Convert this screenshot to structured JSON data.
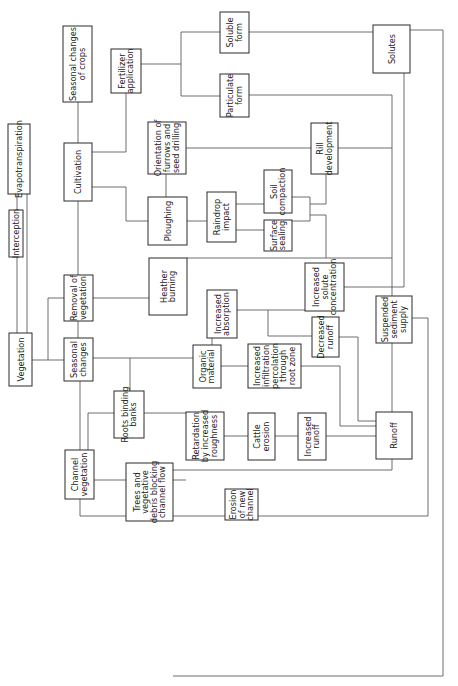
{
  "diagram": {
    "orientation": "rotated-90-ccw",
    "nodes": [
      {
        "id": "vegetation",
        "lines": [
          "Vegetation"
        ],
        "x": 9,
        "y": 333,
        "w": 23,
        "h": 53
      },
      {
        "id": "interception",
        "lines": [
          "Interception"
        ],
        "x": 9,
        "y": 210,
        "w": 14,
        "h": 47
      },
      {
        "id": "evapotranspiration",
        "lines": [
          "Evapotranspiration"
        ],
        "x": 8,
        "y": 124,
        "w": 22,
        "h": 70
      },
      {
        "id": "seasonal-changes-crops",
        "lines": [
          "Seasonal changes",
          "of crops"
        ],
        "x": 63,
        "y": 26,
        "w": 29,
        "h": 76
      },
      {
        "id": "cultivation",
        "lines": [
          "Cultivation"
        ],
        "x": 64,
        "y": 143,
        "w": 28,
        "h": 58
      },
      {
        "id": "fertilizer-application",
        "lines": [
          "Fertilizer",
          "application"
        ],
        "x": 111,
        "y": 49,
        "w": 30,
        "h": 44
      },
      {
        "id": "removal-of-vegetation",
        "lines": [
          "Removal of",
          "vegetation"
        ],
        "x": 64,
        "y": 275,
        "w": 29,
        "h": 46
      },
      {
        "id": "seasonal-changes",
        "lines": [
          "Seasonal",
          "changes"
        ],
        "x": 64,
        "y": 338,
        "w": 29,
        "h": 43
      },
      {
        "id": "channel-vegetation",
        "lines": [
          "Channel",
          "vegetation"
        ],
        "x": 65,
        "y": 450,
        "w": 29,
        "h": 49
      },
      {
        "id": "orientation-furrows",
        "lines": [
          "Orientation of",
          "furrows and",
          "seed drilling"
        ],
        "x": 148,
        "y": 122,
        "w": 38,
        "h": 52
      },
      {
        "id": "ploughing",
        "lines": [
          "Ploughing"
        ],
        "x": 148,
        "y": 197,
        "w": 39,
        "h": 48
      },
      {
        "id": "heather-burning",
        "lines": [
          "Heather",
          "burning"
        ],
        "x": 149,
        "y": 258,
        "w": 38,
        "h": 57
      },
      {
        "id": "soluble-form",
        "lines": [
          "Soluble",
          "form"
        ],
        "x": 220,
        "y": 12,
        "w": 29,
        "h": 41
      },
      {
        "id": "particulate-form",
        "lines": [
          "Particulate",
          "form"
        ],
        "x": 220,
        "y": 74,
        "w": 29,
        "h": 43
      },
      {
        "id": "raindrop-impact",
        "lines": [
          "Raindrop",
          "impact"
        ],
        "x": 207,
        "y": 192,
        "w": 29,
        "h": 50
      },
      {
        "id": "soil-compaction",
        "lines": [
          "Soil",
          "compaction"
        ],
        "x": 264,
        "y": 170,
        "w": 28,
        "h": 43
      },
      {
        "id": "surface-sealing",
        "lines": [
          "Surface",
          "sealing"
        ],
        "x": 264,
        "y": 220,
        "w": 28,
        "h": 31
      },
      {
        "id": "rill-development",
        "lines": [
          "Rill",
          "development"
        ],
        "x": 311,
        "y": 123,
        "w": 27,
        "h": 51
      },
      {
        "id": "increased-absorption",
        "lines": [
          "Increased",
          "absorption"
        ],
        "x": 207,
        "y": 290,
        "w": 30,
        "h": 48
      },
      {
        "id": "increased-solute-concentration",
        "lines": [
          "Increased",
          "solute",
          "concentration"
        ],
        "x": 305,
        "y": 263,
        "w": 39,
        "h": 48
      },
      {
        "id": "organic-material",
        "lines": [
          "Organic",
          "material"
        ],
        "x": 193,
        "y": 345,
        "w": 28,
        "h": 43
      },
      {
        "id": "increased-infiltration",
        "lines": [
          "Increased",
          "infiltration",
          "percolation",
          "through",
          "root zone"
        ],
        "x": 248,
        "y": 344,
        "w": 53,
        "h": 44
      },
      {
        "id": "decreased-runoff",
        "lines": [
          "Decreased",
          "runoff"
        ],
        "x": 312,
        "y": 317,
        "w": 27,
        "h": 40
      },
      {
        "id": "solutes",
        "lines": [
          "Solutes"
        ],
        "x": 373,
        "y": 25,
        "w": 37,
        "h": 48
      },
      {
        "id": "suspended-sediment-supply",
        "lines": [
          "Suspended",
          "sediment",
          "supply"
        ],
        "x": 376,
        "y": 296,
        "w": 36,
        "h": 47
      },
      {
        "id": "roots-binding-banks",
        "lines": [
          "Roots binding",
          "banks"
        ],
        "x": 114,
        "y": 391,
        "w": 30,
        "h": 47
      },
      {
        "id": "retardation",
        "lines": [
          "Retardation",
          "by increased",
          "roughness"
        ],
        "x": 186,
        "y": 412,
        "w": 38,
        "h": 48
      },
      {
        "id": "cattle-erosion",
        "lines": [
          "Cattle",
          "erosion"
        ],
        "x": 248,
        "y": 413,
        "w": 27,
        "h": 47
      },
      {
        "id": "increased-runoff",
        "lines": [
          "Increased",
          "runoff"
        ],
        "x": 298,
        "y": 413,
        "w": 28,
        "h": 47
      },
      {
        "id": "runoff",
        "lines": [
          "Runoff"
        ],
        "x": 376,
        "y": 412,
        "w": 36,
        "h": 47
      },
      {
        "id": "trees-debris",
        "lines": [
          "Trees and",
          "vegetative",
          "debris blocking",
          "channel flow"
        ],
        "x": 126,
        "y": 463,
        "w": 47,
        "h": 58
      },
      {
        "id": "erosion-new-channel",
        "lines": [
          "Erosion",
          "of new",
          "channel"
        ],
        "x": 225,
        "y": 489,
        "w": 33,
        "h": 31
      }
    ],
    "connectors": [
      "M 17 333 L 17 257",
      "M 27 333 L 27 194",
      "M 17 210 L 17 194",
      "M 32 360 L 64 360",
      "M 48 360 L 48 298 L 64 298",
      "M 78 338 L 78 321",
      "M 78 275 L 78 201",
      "M 78 143 L 78 102",
      "M 92 152 L 126 152 L 126 93",
      "M 141 64 L 181 64",
      "M 181 32 L 181 96",
      "M 181 32 L 220 32",
      "M 181 96 L 220 96",
      "M 92 187 L 126 187 L 126 221 L 148 221",
      "M 166 174 L 166 197",
      "M 187 221 L 207 221",
      "M 236 204 L 264 204",
      "M 236 230 L 264 230",
      "M 292 197 L 310 197 L 310 221 L 292 221",
      "M 310 204 L 326 204 L 326 174",
      "M 310 215 L 326 215 L 326 258",
      "M 186 148 L 311 148",
      "M 93 298 L 149 298",
      "M 187 258 L 392 258",
      "M 249 32 L 373 32",
      "M 410 30 L 443 30 L 443 676 L 173 676",
      "M 249 95 L 392 95 L 392 296",
      "M 338 148 L 392 148",
      "M 344 287 L 404 287 L 404 73",
      "M 237 310 L 268 310 L 268 336 L 312 336",
      "M 268 310 L 305 310",
      "M 212 338 L 212 345",
      "M 93 358 L 193 358",
      "M 130 358 L 130 391",
      "M 221 366 L 248 366",
      "M 301 366 L 340 366 L 340 426 L 376 426",
      "M 339 337 L 358 337 L 358 421 L 376 421",
      "M 392 343 L 392 412",
      "M 80 450 L 80 381",
      "M 88 450 L 88 413 L 114 413",
      "M 144 413 L 186 413",
      "M 94 480 L 186 480",
      "M 224 436 L 248 436",
      "M 275 436 L 298 436",
      "M 326 436 L 376 436",
      "M 80 499 L 80 516 L 126 516",
      "M 173 470 L 392 470 L 392 459",
      "M 173 516 L 225 516",
      "M 258 516 L 428 516 L 428 318 L 412 318"
    ]
  }
}
